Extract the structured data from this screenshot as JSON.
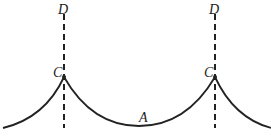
{
  "diagram": {
    "type": "cusped curve with vertical dashed lines",
    "labels": {
      "d_left": "D",
      "d_right": "D",
      "c_left": "C",
      "c_right": "C",
      "a": "A"
    },
    "colors": {
      "stroke": "#222222",
      "background": "#ffffff"
    },
    "points": {
      "cusp_left": [
        63,
        76
      ],
      "cusp_right": [
        214,
        76
      ],
      "bottom_a": [
        139,
        126
      ]
    }
  }
}
